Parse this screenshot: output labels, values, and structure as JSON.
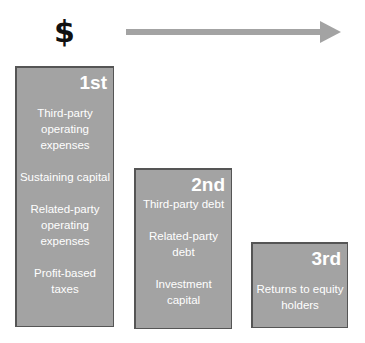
{
  "header": {
    "symbol": "$",
    "arrow": {
      "direction": "right",
      "color": "#a3a3a3"
    }
  },
  "colors": {
    "box_fill": "#a3a3a3",
    "box_border": "#555555",
    "box_text": "#ffffff",
    "symbol": "#111111"
  },
  "boxes": [
    {
      "rank": "1st",
      "items": [
        "Third-party operating expenses",
        "Sustaining capital",
        "Related-party operating expenses",
        "Profit-based taxes"
      ]
    },
    {
      "rank": "2nd",
      "items": [
        "Third-party debt",
        "Related-party debt",
        "Investment capital"
      ]
    },
    {
      "rank": "3rd",
      "items": [
        "Returns to equity holders"
      ]
    }
  ]
}
